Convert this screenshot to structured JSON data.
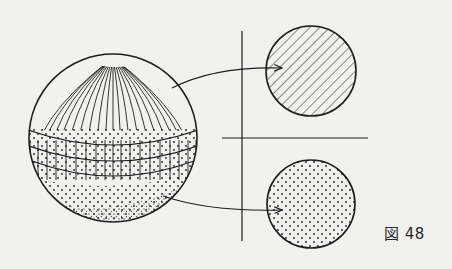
{
  "figure": {
    "caption": "図 48",
    "elements": [
      {
        "id": "sphere",
        "description": "sphere with meridian-hatched upper cap, gridded equatorial band with dots, dotted lower hemisphere"
      },
      {
        "id": "circle-top",
        "description": "cross-section circle with diagonal hatching"
      },
      {
        "id": "circle-bottom",
        "description": "cross-section circle with dot stipple"
      },
      {
        "id": "arrow-top",
        "description": "curved arrow from sphere upper region to hatched circle"
      },
      {
        "id": "arrow-bottom",
        "description": "curved arrow from sphere lower region to dotted circle"
      },
      {
        "id": "axes",
        "description": "vertical and horizontal dividing lines"
      }
    ]
  },
  "colors": {
    "background": "#f1f1ef",
    "ink": "#1e1e1e"
  }
}
